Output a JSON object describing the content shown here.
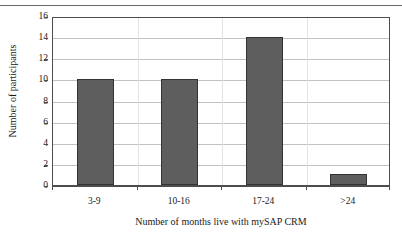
{
  "figure": {
    "top_rule_ghost_text": "",
    "background_color": "#ffffff",
    "bar_fill_color": "#5e5e5e",
    "bar_border_color": "#333333",
    "gridline_color": "#c2c2c2",
    "axis_color": "#4d4d4d"
  },
  "chart_data": {
    "type": "bar",
    "title": "",
    "subtitle": "",
    "xlabel": "Number of months live with mySAP CRM",
    "ylabel": "Number of participants",
    "categories": [
      "3-9",
      "10-16",
      "17-24",
      ">24"
    ],
    "values": [
      10,
      10,
      14,
      1
    ],
    "series": [
      {
        "name": "Number of participants",
        "values": [
          10,
          10,
          14,
          1
        ]
      }
    ],
    "ylim": [
      0,
      16
    ],
    "ytick_values": [
      0,
      2,
      4,
      6,
      8,
      10,
      12,
      14,
      16
    ],
    "ytick_labels": [
      "0",
      "2",
      "4",
      "6",
      "8",
      "10",
      "12",
      "14",
      "16"
    ],
    "xtick_labels": [
      "3-9",
      "10-16",
      "17-24",
      ">24"
    ],
    "grid": "horizontal",
    "legend": "none",
    "annotations": []
  }
}
